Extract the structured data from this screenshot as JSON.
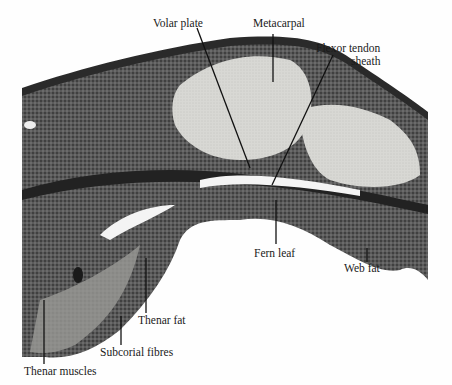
{
  "figure": {
    "type": "histological section (annotated)",
    "labels": {
      "volar_plate": "Volar plate",
      "metacarpal": "Metacarpal",
      "flexor_tendon_sheath_1": "Flexor tendon",
      "flexor_tendon_sheath_2": "sheath",
      "fern_leaf": "Fern leaf",
      "web_fat": "Web fat",
      "thenar_fat": "Thenar fat",
      "subcorial_fibres": "Subcorial fibres",
      "thenar_muscles": "Thenar muscles"
    }
  }
}
